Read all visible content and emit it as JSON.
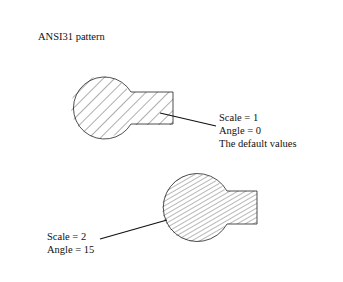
{
  "title": "ANSI31 pattern",
  "figures": [
    {
      "label_lines": [
        "Scale = 1",
        "Angle = 0",
        "The default values"
      ],
      "scale": 1,
      "angle": 0
    },
    {
      "label_lines": [
        "Scale = 2",
        "Angle = 15"
      ],
      "scale": 2,
      "angle": 15
    }
  ]
}
